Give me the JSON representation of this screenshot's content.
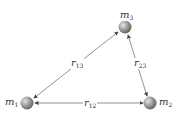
{
  "diagram": {
    "type": "three-body gravitational interaction",
    "masses": [
      {
        "id": "m1",
        "base": "m",
        "sub": "1",
        "x": 27,
        "y": 103
      },
      {
        "id": "m2",
        "base": "m",
        "sub": "2",
        "x": 150,
        "y": 103
      },
      {
        "id": "m3",
        "base": "m",
        "sub": "3",
        "x": 125,
        "y": 27
      }
    ],
    "distances": [
      {
        "id": "r13",
        "base": "r",
        "sub": "13",
        "from": "m1",
        "to": "m3"
      },
      {
        "id": "r23",
        "base": "r",
        "sub": "23",
        "from": "m2",
        "to": "m3"
      },
      {
        "id": "r12",
        "base": "r",
        "sub": "12",
        "from": "m1",
        "to": "m2"
      }
    ],
    "colors": {
      "sphere": "#8a8a8a",
      "line": "#555555",
      "text": "#333333"
    }
  }
}
